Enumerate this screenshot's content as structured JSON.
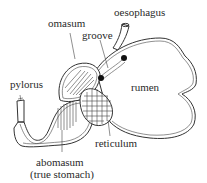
{
  "diagram": {
    "labels": {
      "oesophagus": "oesophagus",
      "omasum": "omasum",
      "groove": "groove",
      "pylorus": "pylorus",
      "rumen": "rumen",
      "reticulum": "reticulum",
      "abomasum": "abomasum",
      "abomasum_note": "(true stomach)"
    },
    "colors": {
      "line": "#333333",
      "text": "#2a2a2a",
      "background": "#ffffff",
      "groove_dot": "#111111"
    }
  }
}
